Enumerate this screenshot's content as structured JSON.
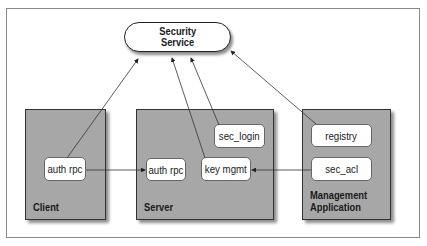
{
  "diagram": {
    "security_service": {
      "line1": "Security",
      "line2": "Service"
    },
    "groups": [
      {
        "id": "client",
        "label_line1": "Client",
        "label_line2": "",
        "components": [
          "auth rpc"
        ]
      },
      {
        "id": "server",
        "label_line1": "Server",
        "label_line2": "",
        "components": [
          "sec_login",
          "auth rpc",
          "key mgmt"
        ]
      },
      {
        "id": "management",
        "label_line1": "Management",
        "label_line2": "Application",
        "components": [
          "registry",
          "sec_acl"
        ]
      }
    ],
    "edges": [
      {
        "from": "client.auth rpc",
        "to": "Security Service"
      },
      {
        "from": "server.key mgmt",
        "to": "Security Service"
      },
      {
        "from": "server.sec_login",
        "to": "Security Service"
      },
      {
        "from": "management.registry",
        "to": "Security Service"
      },
      {
        "from": "client.auth rpc",
        "to": "server.auth rpc"
      },
      {
        "from": "management.sec_acl",
        "to": "server.key mgmt"
      }
    ],
    "colors": {
      "group_fill": "#a7a7a7",
      "group_border": "#333333",
      "node_fill": "#ffffff",
      "line": "#333333"
    }
  }
}
